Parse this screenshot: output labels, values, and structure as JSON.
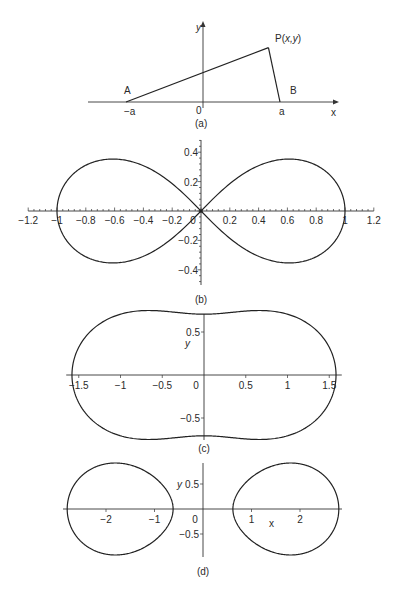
{
  "chart_data": [
    {
      "id": "a",
      "type": "diagram",
      "caption": "(a)",
      "axis_labels": {
        "x": "x",
        "y": "y"
      },
      "origin_label": "0",
      "points": [
        {
          "name": "A",
          "tick_label": "−a",
          "x": -1,
          "y": 0
        },
        {
          "name": "B",
          "tick_label": "a",
          "x": 1,
          "y": 0
        },
        {
          "name": "P(x,y)",
          "x": 0.85,
          "y": 0.68
        }
      ],
      "segments": [
        [
          "A",
          "P(x,y)"
        ],
        [
          "P(x,y)",
          "B"
        ]
      ]
    },
    {
      "id": "b",
      "type": "line",
      "caption": "(b)",
      "curve": "lemniscate of Bernoulli: (x²+y²)² = x² − y²",
      "xlim": [
        -1.2,
        1.2
      ],
      "ylim": [
        -0.5,
        0.5
      ],
      "x_ticks": [
        "−1.2",
        "−1",
        "−0.8",
        "−0.6",
        "−0.4",
        "−0.2",
        "0",
        "0.2",
        "0.4",
        "0.6",
        "0.8",
        "1",
        "1.2"
      ],
      "x_tick_values": [
        -1.2,
        -1,
        -0.8,
        -0.6,
        -0.4,
        -0.2,
        0,
        0.2,
        0.4,
        0.6,
        0.8,
        1,
        1.2
      ],
      "y_ticks": [
        "0.4",
        "0.2",
        "−0.2",
        "−0.4"
      ],
      "y_tick_values": [
        0.4,
        0.2,
        -0.2,
        -0.4
      ],
      "x_intercepts": [
        -1,
        0,
        1
      ],
      "y_extrema": [
        -0.354,
        0.354
      ]
    },
    {
      "id": "c",
      "type": "line",
      "caption": "(c)",
      "ylabel": "y",
      "curve": "Cassini oval, single loop: (x²+y²)² − 2(x² − y²) = 1.25",
      "xlim": [
        -1.6,
        1.6
      ],
      "ylim": [
        -0.75,
        0.75
      ],
      "x_ticks": [
        "−1.5",
        "−1",
        "−0.5",
        "0",
        "0.5",
        "1",
        "1.5"
      ],
      "x_tick_values": [
        -1.5,
        -1,
        -0.5,
        0,
        0.5,
        1,
        1.5
      ],
      "y_ticks": [
        "0.5",
        "−0.5"
      ],
      "y_tick_values": [
        0.5,
        -0.5
      ],
      "x_intercepts": [
        -1.58,
        1.58
      ],
      "y_intercepts": [
        -0.71,
        0.71
      ],
      "y_extrema": [
        -0.75,
        0.75
      ]
    },
    {
      "id": "d",
      "type": "line",
      "caption": "(d)",
      "xlabel": "x",
      "ylabel": "y",
      "curve": "Cassini oval, two loops: (x²+y²)² − 2·4.11(x² − y²) = 13.9 − 16.9",
      "xlim": [
        -2.9,
        2.9
      ],
      "ylim": [
        -0.95,
        0.95
      ],
      "x_ticks": [
        "−2",
        "−1",
        "0",
        "1",
        "2"
      ],
      "x_tick_values": [
        -2,
        -1,
        0,
        1,
        2
      ],
      "y_ticks": [
        "0.5",
        "−0.5"
      ],
      "y_tick_values": [
        0.5,
        -0.5
      ],
      "x_intercepts": [
        -2.8,
        -0.62,
        0.62,
        2.8
      ],
      "y_extrema": [
        -0.93,
        0.93
      ]
    }
  ]
}
